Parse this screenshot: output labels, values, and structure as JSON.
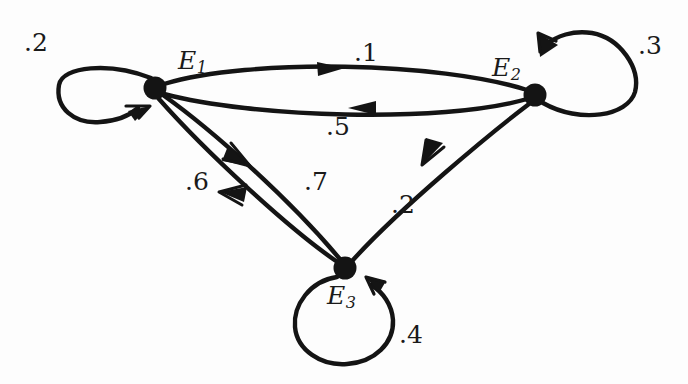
{
  "figure": {
    "kind": "state-transition-diagram",
    "background_color": "#fdfdfd",
    "stroke_color": "#141414",
    "width": 688,
    "height": 384
  },
  "nodes": [
    {
      "id": "E1",
      "label": "E",
      "subscript": "1",
      "x": 155,
      "y": 88,
      "radius": 11,
      "label_x": 178,
      "label_y": 48
    },
    {
      "id": "E2",
      "label": "E",
      "subscript": "2",
      "x": 535,
      "y": 95,
      "radius": 11,
      "label_x": 492,
      "label_y": 55
    },
    {
      "id": "E3",
      "label": "E",
      "subscript": "3",
      "x": 345,
      "y": 268,
      "radius": 11,
      "label_x": 327,
      "label_y": 283
    }
  ],
  "edges": [
    {
      "id": "e1-e1",
      "from": "E1",
      "to": "E1",
      "weight": ".2",
      "type": "self-loop",
      "label_x": 24,
      "label_y": 30
    },
    {
      "id": "e2-e2",
      "from": "E2",
      "to": "E2",
      "weight": ".3",
      "type": "self-loop",
      "label_x": 638,
      "label_y": 33
    },
    {
      "id": "e3-e3",
      "from": "E3",
      "to": "E3",
      "weight": ".4",
      "type": "self-loop",
      "label_x": 399,
      "label_y": 322
    },
    {
      "id": "e1-e2",
      "from": "E1",
      "to": "E2",
      "weight": ".1",
      "type": "curve",
      "label_x": 354,
      "label_y": 40
    },
    {
      "id": "e2-e1",
      "from": "E2",
      "to": "E1",
      "weight": ".5",
      "type": "curve",
      "label_x": 326,
      "label_y": 114
    },
    {
      "id": "e1-e3",
      "from": "E1",
      "to": "E3",
      "weight": ".7",
      "type": "curve",
      "label_x": 304,
      "label_y": 169
    },
    {
      "id": "e3-e1",
      "from": "E3",
      "to": "E1",
      "weight": ".6",
      "type": "curve",
      "label_x": 185,
      "label_y": 169
    },
    {
      "id": "e2-e3",
      "from": "E2",
      "to": "E3",
      "weight": ".2",
      "type": "curve",
      "label_x": 391,
      "label_y": 192
    }
  ]
}
